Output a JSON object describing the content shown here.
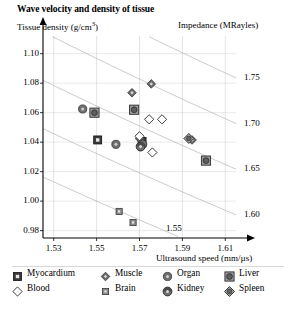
{
  "chart_data": {
    "type": "scatter",
    "title": "Wave velocity and density of tissue",
    "xlabel": "Ultrasound speed (mm/µs)",
    "ylabel": "Tissue density (g/cm³)",
    "ylabel_text": "Tissue density (g/cm",
    "ylabel_sup": "3",
    "ylabel_tail": ")",
    "secondary_axis_label": "Impedance (MRayles)",
    "xlim": [
      1.525,
      1.615
    ],
    "ylim": [
      0.975,
      1.112
    ],
    "xticks": [
      "1.53",
      "1.55",
      "1.57",
      "1.59",
      "1.61"
    ],
    "xtick_values": [
      1.53,
      1.55,
      1.57,
      1.59,
      1.61
    ],
    "yticks": [
      "0.98",
      "1.00",
      "1.02",
      "1.04",
      "1.06",
      "1.08",
      "1.10"
    ],
    "ytick_values": [
      0.98,
      1.0,
      1.02,
      1.04,
      1.06,
      1.08,
      1.1
    ],
    "grid": true,
    "legend_position": "below-plot",
    "contours": {
      "description": "Lines of constant acoustic impedance Z = density x speed (MRayles)",
      "labels": [
        "1.75",
        "1.70",
        "1.65",
        "1.60",
        "1.55"
      ],
      "values": [
        1.75,
        1.7,
        1.65,
        1.6,
        1.55
      ],
      "label_side": [
        "right",
        "right",
        "right",
        "right",
        "inside"
      ]
    },
    "series": [
      {
        "name": "Myocardium",
        "marker": "square-filled",
        "points": [
          {
            "x": 1.5505,
            "y": 1.0415
          },
          {
            "x": 1.5712,
            "y": 1.0405
          }
        ]
      },
      {
        "name": "Muscle",
        "marker": "diamond-filled",
        "points": [
          {
            "x": 1.5665,
            "y": 1.0735
          },
          {
            "x": 1.5755,
            "y": 1.0795
          },
          {
            "x": 1.57,
            "y": 1.0425
          },
          {
            "x": 1.5945,
            "y": 1.0415
          }
        ]
      },
      {
        "name": "Organ",
        "marker": "circle-filled",
        "points": [
          {
            "x": 1.5435,
            "y": 1.0625
          },
          {
            "x": 1.559,
            "y": 1.0385
          },
          {
            "x": 1.5715,
            "y": 1.0385
          }
        ]
      },
      {
        "name": "Liver",
        "marker": "square-circle",
        "points": [
          {
            "x": 1.549,
            "y": 1.06
          },
          {
            "x": 1.5675,
            "y": 1.062
          },
          {
            "x": 1.601,
            "y": 1.0275
          }
        ]
      },
      {
        "name": "Blood",
        "marker": "diamond-open",
        "points": [
          {
            "x": 1.5745,
            "y": 1.0555
          },
          {
            "x": 1.5805,
            "y": 1.0555
          },
          {
            "x": 1.57,
            "y": 1.044
          },
          {
            "x": 1.576,
            "y": 1.033
          }
        ]
      },
      {
        "name": "Brain",
        "marker": "square-small",
        "points": [
          {
            "x": 1.5605,
            "y": 0.993
          },
          {
            "x": 1.567,
            "y": 0.9855
          }
        ]
      },
      {
        "name": "Kidney",
        "marker": "circle-shaded",
        "points": [
          {
            "x": 1.5705,
            "y": 1.037
          }
        ]
      },
      {
        "name": "Spleen",
        "marker": "diamond-shaded",
        "points": [
          {
            "x": 1.593,
            "y": 1.0425
          }
        ]
      }
    ]
  },
  "legend": {
    "rows": [
      [
        {
          "label": "Myocardium",
          "marker": "square-filled"
        },
        {
          "label": "Muscle",
          "marker": "diamond-filled"
        },
        {
          "label": "Organ",
          "marker": "circle-filled"
        },
        {
          "label": "Liver",
          "marker": "square-circle"
        }
      ],
      [
        {
          "label": "Blood",
          "marker": "diamond-open"
        },
        {
          "label": "Brain",
          "marker": "square-small"
        },
        {
          "label": "Kidney",
          "marker": "circle-shaded"
        },
        {
          "label": "Spleen",
          "marker": "diamond-shaded"
        }
      ]
    ]
  },
  "colors": {
    "axis": "#000000",
    "grid": "#c9c9c9",
    "contour": "#a8a8a8",
    "marker_fill": "#6e6e6e",
    "marker_edge": "#2a2a2a",
    "background": "#ffffff"
  }
}
